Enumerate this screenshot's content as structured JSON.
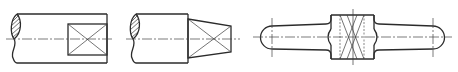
{
  "figure": {
    "title": "",
    "colors": {
      "line": "#2b2b2b",
      "background": "#ffffff"
    },
    "views": [
      {
        "id": "shaft-square-end",
        "label": "",
        "features": [
          "broken-shaft-section",
          "square-flat-end-cross"
        ]
      },
      {
        "id": "shaft-tapered-end",
        "label": "",
        "features": [
          "broken-shaft-section",
          "tapered-flat-end-cross"
        ]
      },
      {
        "id": "handle-with-flats",
        "label": "",
        "features": [
          "rounded-ends",
          "central-knurled-block-cross",
          "hidden-lines"
        ]
      }
    ]
  }
}
